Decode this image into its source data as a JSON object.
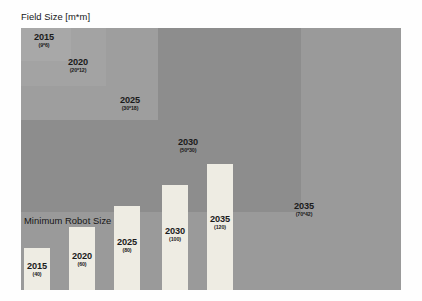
{
  "figure": {
    "background": "#fefefe",
    "width": 422,
    "height": 301
  },
  "captions": {
    "field_size": "Field Size [m*m]",
    "robot_size": "Minimum Robot Size [cm]"
  },
  "chart_data": {
    "type": "bar",
    "title": "",
    "charts": [
      {
        "type": "area",
        "name": "Field Size",
        "title": "Field Size [m*m]",
        "unit": "m*m",
        "categories": [
          "2015",
          "2020",
          "2025",
          "2030",
          "2035"
        ],
        "values": [
          54,
          240,
          540,
          1500,
          2940
        ],
        "dimensions": [
          {
            "year": "2015",
            "width_m": 9,
            "height_m": 6,
            "label": "(9*6)"
          },
          {
            "year": "2020",
            "width_m": 20,
            "height_m": 12,
            "label": "(20*12)"
          },
          {
            "year": "2025",
            "width_m": 30,
            "height_m": 18,
            "label": "(30*18)"
          },
          {
            "year": "2030",
            "width_m": 50,
            "height_m": 30,
            "label": "(50*30)"
          },
          {
            "year": "2035",
            "width_m": 70,
            "height_m": 42,
            "label": "(70*42)"
          }
        ]
      },
      {
        "type": "bar",
        "name": "Minimum Robot Size",
        "title": "Minimum Robot Size [cm]",
        "unit": "cm",
        "categories": [
          "2015",
          "2020",
          "2025",
          "2030",
          "2035"
        ],
        "values": [
          40,
          60,
          80,
          100,
          120
        ],
        "ylabel": "cm",
        "ylim": [
          0,
          120
        ],
        "grid": false,
        "legend": "none"
      }
    ]
  },
  "field_rects": [
    {
      "id": "rect-2015",
      "year": "2015",
      "dims": "(9*6)",
      "color": "#a8a8a8",
      "left": 21,
      "top": 28,
      "width": 50,
      "height": 33,
      "label_cx": 44,
      "label_top": 33
    },
    {
      "id": "rect-2020",
      "year": "2020",
      "dims": "(20*12)",
      "color": "#a3a3a3",
      "left": 21,
      "top": 28,
      "width": 85,
      "height": 58,
      "label_cx": 78,
      "label_top": 58
    },
    {
      "id": "rect-2025",
      "year": "2025",
      "dims": "(30*18)",
      "color": "#9e9e9e",
      "left": 21,
      "top": 28,
      "width": 137,
      "height": 92,
      "label_cx": 130,
      "label_top": 96
    },
    {
      "id": "rect-2030",
      "year": "2030",
      "dims": "(50*30)",
      "color": "#8d8d8d",
      "left": 21,
      "top": 28,
      "width": 280,
      "height": 184,
      "label_cx": 188,
      "label_top": 138
    },
    {
      "id": "rect-2035",
      "year": "2035",
      "dims": "(70*42)",
      "color": "#9a9a9a",
      "left": 21,
      "top": 28,
      "width": 380,
      "height": 262,
      "label_cx": 304,
      "label_top": 202
    }
  ],
  "bars": [
    {
      "id": "bar-2015",
      "year": "2015",
      "value": "(40)",
      "color": "#eeece3",
      "left": 24,
      "width": 26,
      "height": 42,
      "bottom": 11,
      "label_cx": 37,
      "label_top": 262
    },
    {
      "id": "bar-2020",
      "year": "2020",
      "value": "(60)",
      "color": "#eeece3",
      "left": 69,
      "width": 26,
      "height": 63,
      "bottom": 11,
      "label_cx": 82,
      "label_top": 252
    },
    {
      "id": "bar-2025",
      "year": "2025",
      "value": "(80)",
      "color": "#eeece3",
      "left": 114,
      "width": 26,
      "height": 84,
      "bottom": 11,
      "label_cx": 127,
      "label_top": 238
    },
    {
      "id": "bar-2030",
      "year": "2030",
      "value": "(100)",
      "color": "#eeece3",
      "left": 162,
      "width": 26,
      "height": 105,
      "bottom": 11,
      "label_cx": 175,
      "label_top": 227
    },
    {
      "id": "bar-2035",
      "year": "2035",
      "value": "(120)",
      "color": "#eeece3",
      "left": 207,
      "width": 26,
      "height": 126,
      "bottom": 11,
      "label_cx": 220,
      "label_top": 215
    }
  ],
  "caption_positions": {
    "field_size": {
      "left": 21,
      "top": 11
    },
    "robot_size": {
      "left": 24,
      "top": 215
    }
  }
}
